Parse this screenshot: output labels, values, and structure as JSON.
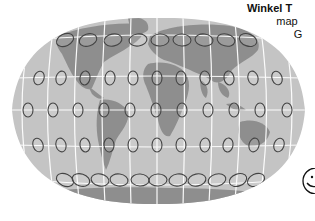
{
  "caption": {
    "title": "Winkel T",
    "line2": "map",
    "line3": "G"
  },
  "map": {
    "projection": "winkel-tripel",
    "ocean_color": "#c4c4c4",
    "land_color": "#8f8f8f",
    "graticule_color": "#ffffff",
    "indicatrix_color": "#444444",
    "indicatrix_rows": [
      {
        "y": 40,
        "xs": [
          65,
          88,
          113,
          138,
          160,
          182,
          204,
          226,
          248
        ],
        "rx": 9,
        "ry": 6,
        "tilt": [
          -25,
          -18,
          -12,
          -8,
          -3,
          3,
          8,
          14,
          20
        ]
      },
      {
        "y": 78,
        "xs": [
          39,
          61,
          85,
          110,
          133,
          157,
          181,
          205,
          229,
          253,
          277
        ],
        "rx": 5,
        "ry": 7,
        "tilt": [
          20,
          15,
          10,
          5,
          0,
          0,
          0,
          -5,
          -10,
          -15,
          -20
        ]
      },
      {
        "y": 110,
        "xs": [
          28,
          53,
          78,
          104,
          130,
          156,
          182,
          208,
          234,
          260,
          287
        ],
        "rx": 5,
        "ry": 7,
        "tilt": [
          0,
          0,
          0,
          0,
          0,
          0,
          0,
          0,
          0,
          0,
          0
        ]
      },
      {
        "y": 145,
        "xs": [
          38,
          61,
          85,
          109,
          133,
          157,
          181,
          205,
          228,
          254,
          279
        ],
        "rx": 5,
        "ry": 7,
        "tilt": [
          -20,
          -15,
          -10,
          -5,
          0,
          0,
          0,
          5,
          10,
          15,
          20
        ]
      },
      {
        "y": 180,
        "xs": [
          65,
          81,
          100,
          119,
          140,
          158,
          178,
          197,
          217,
          238,
          256
        ],
        "rx": 9,
        "ry": 6,
        "tilt": [
          25,
          18,
          12,
          8,
          3,
          -3,
          -8,
          -12,
          -16,
          -20,
          -25
        ]
      }
    ]
  },
  "icon": "smiley-icon"
}
